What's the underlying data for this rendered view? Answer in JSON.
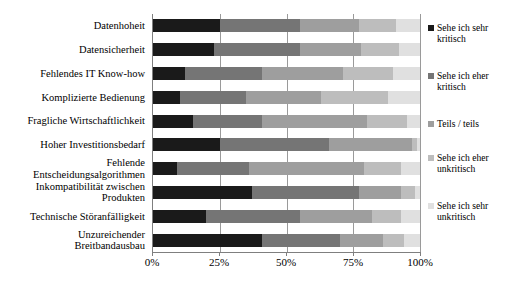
{
  "chart_data": {
    "type": "bar",
    "orientation": "horizontal",
    "stacked": true,
    "normalized": true,
    "title": "",
    "subtitle": "",
    "xlabel": "",
    "ylabel": "",
    "xlim": [
      0,
      100
    ],
    "xticks": [
      0,
      25,
      50,
      75,
      100
    ],
    "xticklabels": [
      "0%",
      "25%",
      "50%",
      "75%",
      "100%"
    ],
    "grid": "vertical",
    "legend_position": "right",
    "categories": [
      "Datenhoheit",
      "Datensicherheit",
      "Fehlendes IT Know-how",
      "Komplizierte Bedienung",
      "Fragliche Wirtschaftlichkeit",
      "Hoher Investitionsbedarf",
      "Fehlende\nEntscheidungsalgorithmen",
      "Inkompatibilität zwischen\nProdukten",
      "Technische Störanfälligkeit",
      "Unzureichender\nBreitbandausbau"
    ],
    "series": [
      {
        "name": "Sehe ich sehr kritisch",
        "color": "#1a1a1a",
        "values": [
          25,
          23,
          12,
          10,
          15,
          25,
          9,
          37,
          20,
          41
        ]
      },
      {
        "name": "Sehe ich eher kritisch",
        "color": "#757575",
        "values": [
          30,
          32,
          29,
          25,
          26,
          41,
          27,
          40,
          35,
          29
        ]
      },
      {
        "name": "Teils / teils",
        "color": "#9e9e9e",
        "values": [
          22,
          23,
          30,
          28,
          39,
          31,
          43,
          16,
          27,
          16
        ]
      },
      {
        "name": "Sehe ich eher unkritisch",
        "color": "#bdbdbd",
        "values": [
          14,
          14,
          19,
          25,
          15,
          2,
          14,
          5,
          11,
          8
        ]
      },
      {
        "name": "Sehe ich sehr unkritisch",
        "color": "#e0e0e0",
        "values": [
          9,
          8,
          10,
          12,
          5,
          1,
          7,
          2,
          7,
          6
        ]
      }
    ]
  },
  "legend": {
    "items": [
      {
        "label": "Sehe ich sehr\nkritisch",
        "color": "#1a1a1a"
      },
      {
        "label": "Sehe ich eher\nkritisch",
        "color": "#757575"
      },
      {
        "label": "Teils / teils",
        "color": "#9e9e9e"
      },
      {
        "label": "Sehe ich eher\nunkritisch",
        "color": "#bdbdbd"
      },
      {
        "label": "Sehe ich sehr\nunkritisch",
        "color": "#e0e0e0"
      }
    ]
  },
  "axis": {
    "background": "#ffffff",
    "line_color": "#7f7f7f",
    "grid_color": "#9a9a9a"
  }
}
